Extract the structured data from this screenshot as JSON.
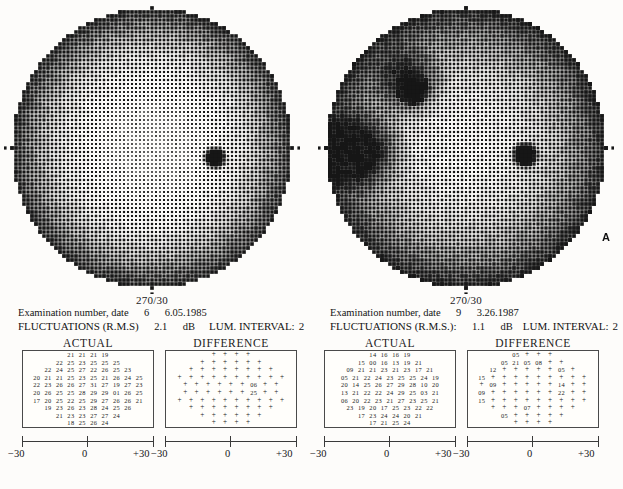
{
  "meta": {
    "side_letter": "A"
  },
  "exams": [
    {
      "id": "left",
      "map_scale_label": "270/30",
      "header": {
        "exam_label": "Examination number, date",
        "exam_number": "6",
        "exam_date": "6.05.1985",
        "fluctuations_label": "FLUCTUATIONS (R.M.S)",
        "fluctuations_value": "2.1",
        "fluctuations_unit": "dB",
        "lum_interval_label": "LUM. INTERVAL:",
        "lum_interval_value": "2"
      },
      "actual": {
        "title": "ACTUAL",
        "rows": [
          [
            "21",
            "21",
            "21",
            "19"
          ],
          [
            "22",
            "25",
            "23",
            "25",
            "25",
            "25"
          ],
          [
            "22",
            "24",
            "25",
            "27",
            "22",
            "26",
            "25",
            "23"
          ],
          [
            "20",
            "21",
            "21",
            "25",
            "23",
            "25",
            "21",
            "26",
            "24",
            "25"
          ],
          [
            "22",
            "23",
            "26",
            "26",
            "27",
            "31",
            "27",
            "19",
            "27",
            "23"
          ],
          [
            "20",
            "26",
            "25",
            "25",
            "28",
            "29",
            "29",
            "01",
            "26",
            "25"
          ],
          [
            "17",
            "20",
            "25",
            "22",
            "25",
            "29",
            "27",
            "26",
            "26",
            "21"
          ],
          [
            "19",
            "23",
            "26",
            "23",
            "28",
            "24",
            "25",
            "26"
          ],
          [
            "21",
            "23",
            "23",
            "27",
            "27",
            "24"
          ],
          [
            "18",
            "25",
            "26",
            "24"
          ]
        ]
      },
      "difference": {
        "title": "DIFFERENCE",
        "rows": [
          [
            "+",
            "+",
            "+",
            "+"
          ],
          [
            "+",
            "+",
            "+",
            "+",
            "+",
            "+"
          ],
          [
            "+",
            "+",
            "+",
            "+",
            "+",
            "+",
            "+",
            "+"
          ],
          [
            "+",
            "+",
            "+",
            "+",
            "+",
            "+",
            "+",
            "+",
            "+",
            "+"
          ],
          [
            "+",
            "+",
            "+",
            "+",
            "+",
            "+",
            "06",
            "+",
            "+"
          ],
          [
            "+",
            "+",
            "+",
            "+",
            "+",
            "+",
            "25",
            "+",
            "+"
          ],
          [
            "+",
            "+",
            "+",
            "+",
            "+",
            "+",
            "+",
            "+",
            "+",
            "+"
          ],
          [
            "+",
            "+",
            "+",
            "+",
            "+",
            "+",
            "+",
            "+"
          ],
          [
            "+",
            "+",
            "+",
            "+",
            "+",
            "+"
          ],
          [
            "+",
            "+",
            "+",
            "+"
          ]
        ],
        "bleed_left": [
          "6"
        ],
        "bleed_left_row": 6
      },
      "axis": {
        "left_label": "−30",
        "center_label": "0",
        "right_label": "+30"
      }
    },
    {
      "id": "right",
      "map_scale_label": "270/30",
      "header": {
        "exam_label": "Examination number, date",
        "exam_number": "9",
        "exam_date": "3.26.1987",
        "fluctuations_label": "FLUCTUATIONS (R.M.S.):",
        "fluctuations_value": "1.1",
        "fluctuations_unit": "dB",
        "lum_interval_label": "LUM. INTERVAL:",
        "lum_interval_value": "2"
      },
      "actual": {
        "title": "ACTUAL",
        "rows": [
          [
            "14",
            "16",
            "16",
            "19"
          ],
          [
            "15",
            "00",
            "16",
            "13",
            "19",
            "21"
          ],
          [
            "09",
            "21",
            "21",
            "23",
            "21",
            "23",
            "17",
            "21"
          ],
          [
            "05",
            "21",
            "22",
            "24",
            "23",
            "25",
            "25",
            "24",
            "19"
          ],
          [
            "20",
            "14",
            "25",
            "26",
            "27",
            "29",
            "28",
            "10",
            "20"
          ],
          [
            "13",
            "21",
            "22",
            "22",
            "24",
            "29",
            "25",
            "03",
            "21"
          ],
          [
            "06",
            "20",
            "22",
            "23",
            "21",
            "27",
            "23",
            "25",
            "21"
          ],
          [
            "23",
            "19",
            "20",
            "17",
            "25",
            "23",
            "22",
            "22"
          ],
          [
            "17",
            "23",
            "24",
            "24",
            "20",
            "21"
          ],
          [
            "17",
            "21",
            "25",
            "24"
          ]
        ]
      },
      "difference": {
        "title": "DIFFERENCE",
        "rows": [
          [
            "05",
            "+",
            "+",
            "+"
          ],
          [
            "05",
            "21",
            "05",
            "08",
            "+",
            "+"
          ],
          [
            "12",
            "+",
            "+",
            "+",
            "+",
            "+",
            "05",
            "+"
          ],
          [
            "15",
            "+",
            "+",
            "+",
            "+",
            "+",
            "+",
            "+",
            "+",
            "+"
          ],
          [
            "+",
            "09",
            "+",
            "+",
            "+",
            "+",
            "+",
            "14",
            "+",
            "+"
          ],
          [
            "09",
            "+",
            "+",
            "+",
            "+",
            "+",
            "+",
            "22",
            "+",
            "+"
          ],
          [
            "15",
            "+",
            "+",
            "+",
            "+",
            "+",
            "+",
            "+",
            "+",
            "+"
          ],
          [
            "+",
            "+",
            "+",
            "07",
            "+",
            "+",
            "+",
            "+"
          ],
          [
            "05",
            "+",
            "+",
            "+",
            "+",
            "+"
          ],
          [
            "+",
            "+",
            "+",
            "+"
          ]
        ]
      },
      "axis": {
        "left_label": "−30",
        "center_label": "0",
        "right_label": "+30"
      }
    }
  ],
  "field_maps": {
    "left": {
      "radius_px": 140,
      "dot_pitch": 4.0,
      "base_darkness": 0.3,
      "edge_darkness": 0.92,
      "blind_spots": [
        {
          "cx": 0.45,
          "cy": 0.07,
          "r": 0.1,
          "intensity": 1.0
        }
      ],
      "depressed_zones": []
    },
    "right": {
      "radius_px": 140,
      "dot_pitch": 4.0,
      "base_darkness": 0.46,
      "edge_darkness": 0.95,
      "blind_spots": [
        {
          "cx": 0.42,
          "cy": 0.05,
          "r": 0.11,
          "intensity": 1.0
        },
        {
          "cx": -0.38,
          "cy": -0.42,
          "r": 0.13,
          "intensity": 0.95
        }
      ],
      "depressed_zones": [
        {
          "cx": -0.72,
          "cy": 0.02,
          "r": 0.34,
          "intensity": 0.85
        },
        {
          "cx": -0.4,
          "cy": -0.46,
          "r": 0.3,
          "intensity": 0.75
        }
      ]
    }
  }
}
